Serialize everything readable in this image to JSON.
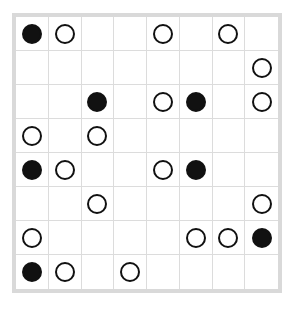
{
  "puzzle": {
    "type": "masyu",
    "rows": 8,
    "cols": 8,
    "colors": {
      "black": "#111111",
      "white": "#ffffff",
      "grid_line": "#dcdcdc",
      "border": "#d9d9d9"
    },
    "grid": [
      [
        "B",
        "W",
        "",
        "",
        "W",
        "",
        "W",
        ""
      ],
      [
        "",
        "",
        "",
        "",
        "",
        "",
        "",
        "W"
      ],
      [
        "",
        "",
        "B",
        "",
        "W",
        "B",
        "",
        "W"
      ],
      [
        "W",
        "",
        "W",
        "",
        "",
        "",
        "",
        ""
      ],
      [
        "B",
        "W",
        "",
        "",
        "W",
        "B",
        "",
        ""
      ],
      [
        "",
        "",
        "W",
        "",
        "",
        "",
        "",
        "W"
      ],
      [
        "W",
        "",
        "",
        "",
        "",
        "W",
        "W",
        "B"
      ],
      [
        "B",
        "W",
        "",
        "W",
        "",
        "",
        "",
        ""
      ]
    ]
  }
}
